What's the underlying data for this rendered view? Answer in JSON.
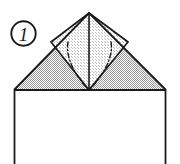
{
  "diagram": {
    "step_label": "1",
    "type": "origami-instruction",
    "canvas": {
      "width": 180,
      "height": 164
    },
    "colors": {
      "background": "#ffffff",
      "stroke": "#1a1a1a",
      "shaded_paper": "#c9c9c9",
      "light_paper": "#ececec",
      "white_paper": "#ffffff",
      "fold_line": "#1a1a1a"
    },
    "step_badge": {
      "label": "1",
      "shape": "circle",
      "center_x": 23.5,
      "center_y": 33.5,
      "radius": 12.5
    },
    "shapes": {
      "body_rectangle": {
        "name": "paper-body-rectangle",
        "fill": "white_paper",
        "points": "14,90 166,90 166,170 14,170"
      },
      "left_wing": {
        "name": "left-shaded-wing",
        "fill": "shaded_paper",
        "points": "14,90 89,13 89,90"
      },
      "right_wing": {
        "name": "right-shaded-wing",
        "fill": "shaded_paper",
        "points": "89,13 166,90 89,90"
      },
      "center_diamond": {
        "name": "center-diamond-flap",
        "fill": "light_paper",
        "points": "89,13 128,42 89,90 51,42"
      }
    },
    "fold_lines": [
      {
        "name": "left-mountain-fold",
        "style": "dash-dot",
        "path": "M 68,42 C 65,58 76,76 87,88"
      },
      {
        "name": "right-mountain-fold",
        "style": "dash-dot",
        "path": "M 111,42 C 114,58 102,76 91,88"
      }
    ],
    "solid_lines": [
      {
        "name": "center-vertical-crease",
        "path": "M 89,13 L 89,90"
      },
      {
        "name": "left-outer-edge",
        "path": "M 14,90 L 89,13"
      },
      {
        "name": "right-outer-edge",
        "path": "M 89,13 L 166,90"
      },
      {
        "name": "horizontal-base-edge",
        "path": "M 14,90 L 166,90"
      },
      {
        "name": "left-body-edge",
        "path": "M 14,90 L 14,164"
      },
      {
        "name": "right-body-edge",
        "path": "M 166,90 L 166,164"
      },
      {
        "name": "diamond-left-upper-edge",
        "path": "M 89,13 L 51,42"
      },
      {
        "name": "diamond-right-upper-edge",
        "path": "M 89,13 L 128,42"
      },
      {
        "name": "diamond-left-lower-edge",
        "path": "M 51,42 L 89,90"
      },
      {
        "name": "diamond-right-lower-edge",
        "path": "M 128,42 L 89,90"
      }
    ]
  }
}
